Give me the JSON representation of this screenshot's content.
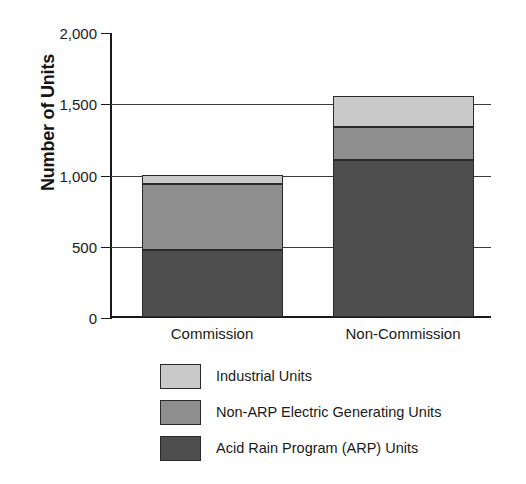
{
  "chart_data": {
    "type": "bar",
    "subtype": "stacked-vertical",
    "title": "",
    "xlabel": "",
    "ylabel": "Number of Units",
    "categories": [
      "Commission",
      "Non-Commission"
    ],
    "series": [
      {
        "name": "Acid Rain Program (ARP) Units",
        "color": "#4e4e4e",
        "values": [
          470,
          1100
        ]
      },
      {
        "name": "Non-ARP Electric Generating Units",
        "color": "#8e8e8e",
        "values": [
          460,
          230
        ]
      },
      {
        "name": "Industrial Units",
        "color": "#c9c9c9",
        "values": [
          70,
          220
        ]
      }
    ],
    "stack_order_bottom_to_top": [
      "Acid Rain Program (ARP) Units",
      "Non-ARP Electric Generating Units",
      "Industrial Units"
    ],
    "totals": [
      1000,
      1550
    ],
    "ylim": [
      0,
      2000
    ],
    "yticks": [
      0,
      500,
      1000,
      1500,
      2000
    ],
    "ytick_labels": [
      "0",
      "500",
      "1,000",
      "1,500",
      "2,000"
    ],
    "grid": true,
    "grid_axis": "y",
    "legend_position": "bottom"
  },
  "axis": {
    "y_title": "Number of Units",
    "ticks": [
      {
        "value": 2000,
        "label": "2,000"
      },
      {
        "value": 1500,
        "label": "1,500"
      },
      {
        "value": 1000,
        "label": "1,000"
      },
      {
        "value": 500,
        "label": "500"
      },
      {
        "value": 0,
        "label": "0"
      }
    ]
  },
  "categories": [
    {
      "label": "Commission"
    },
    {
      "label": "Non-Commission"
    }
  ],
  "legend": {
    "items": [
      {
        "label": "Industrial Units",
        "color": "#c9c9c9"
      },
      {
        "label": "Non-ARP Electric Generating Units",
        "color": "#8e8e8e"
      },
      {
        "label": "Acid Rain Program (ARP) Units",
        "color": "#4e4e4e"
      }
    ]
  }
}
